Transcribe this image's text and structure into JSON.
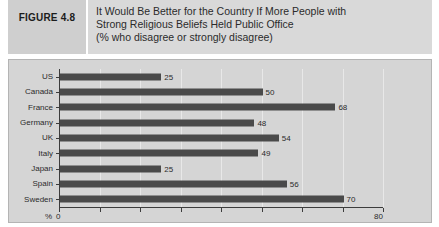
{
  "header": {
    "figure_label": "FIGURE 4.8",
    "title_lines": [
      "It Would Be Better for the Country If More People with",
      "Strong Religious Beliefs Held Public Office",
      "(% who disagree or strongly disagree)"
    ]
  },
  "colors": {
    "header_band": "#d9d9d9",
    "figure_label_box": "#cfcfcf",
    "panel_background": "#d5d5d5",
    "bar": "#4a4a4a",
    "axis": "#3c3c3c",
    "gridline": "#e8e8e8",
    "text": "#2b2b2b"
  },
  "chart_data": {
    "type": "bar",
    "orientation": "horizontal",
    "title": "It Would Be Better for the Country If More People with Strong Religious Beliefs Held Public Office",
    "subtitle": "(% who disagree or strongly disagree)",
    "categories": [
      "US",
      "Canada",
      "France",
      "Germany",
      "UK",
      "Italy",
      "Japan",
      "Spain",
      "Sweden"
    ],
    "values": [
      25,
      50,
      68,
      48,
      54,
      49,
      25,
      56,
      70
    ],
    "xlabel": "%",
    "ylabel": "",
    "xlim": [
      0,
      80
    ],
    "xticks": [
      0,
      10,
      20,
      30,
      40,
      50,
      60,
      70,
      80
    ],
    "xtick_labels": [
      "0",
      "",
      "",
      "",
      "",
      "",
      "",
      "",
      "80"
    ],
    "axis_prefix_label": "%",
    "grid": true,
    "grid_axis": "x",
    "legend": false,
    "data_labels": true
  }
}
